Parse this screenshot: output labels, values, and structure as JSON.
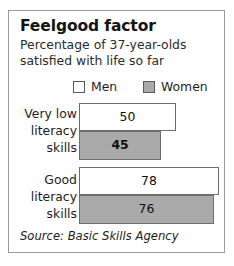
{
  "card": {
    "title": "Feelgood factor",
    "subtitle_lines": [
      "Percentage of 37-year-olds",
      "satisfied with life so far"
    ],
    "source": "Source: Basic Skills Agency"
  },
  "legend": {
    "men": {
      "label": "Men",
      "swatch": "white-square-icon",
      "color": "#ffffff"
    },
    "women": {
      "label": "Women",
      "swatch": "gray-square-icon",
      "color": "#aaaaaa"
    }
  },
  "groups": [
    {
      "label_lines": [
        "Very low",
        "literacy",
        "skills"
      ],
      "men_value": "50",
      "women_value": "45",
      "men_width_px": 97,
      "women_width_px": 82
    },
    {
      "label_lines": [
        "Good",
        "literacy",
        "skills"
      ],
      "men_value": "78",
      "women_value": "76",
      "men_width_px": 140,
      "women_width_px": 135
    }
  ],
  "chart_data": {
    "type": "bar",
    "orientation": "horizontal",
    "title": "Feelgood factor",
    "subtitle": "Percentage of 37-year-olds satisfied with life so far",
    "categories": [
      "Very low literacy skills",
      "Good literacy skills"
    ],
    "series": [
      {
        "name": "Men",
        "values": [
          50,
          45
        ]
      },
      {
        "name": "Women",
        "values": [
          45,
          76
        ]
      }
    ],
    "series_corrected": [
      {
        "name": "Men",
        "values": [
          50,
          78
        ],
        "color": "#ffffff"
      },
      {
        "name": "Women",
        "values": [
          45,
          76
        ],
        "color": "#aaaaaa"
      }
    ],
    "data_labels": [
      [
        "50",
        "45"
      ],
      [
        "78",
        "76"
      ]
    ],
    "xlabel": "",
    "ylabel": "",
    "xlim": [
      0,
      100
    ],
    "grid": false,
    "legend_position": "top",
    "source": "Source: Basic Skills Agency",
    "units": "percent"
  }
}
